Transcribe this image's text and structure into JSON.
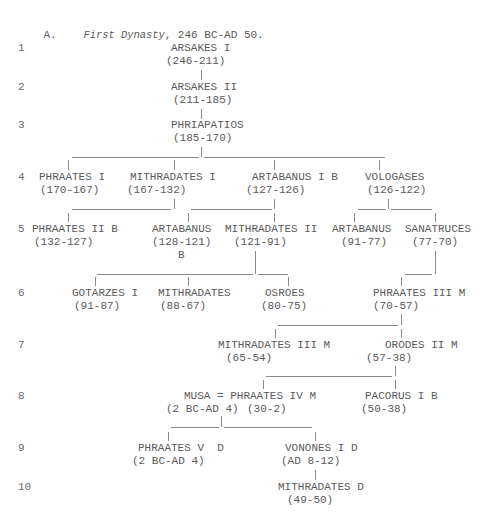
{
  "document": {
    "heading": {
      "prefix": "A.",
      "italic": "First Dynasty",
      "suffix": ", 246 BC-AD 50.",
      "x": 17,
      "y": 23,
      "italic_x": 57
    },
    "generations": [
      {
        "label": "1",
        "y": 49
      },
      {
        "label": "2",
        "y": 88
      },
      {
        "label": "3",
        "y": 126
      },
      {
        "label": "4",
        "y": 178
      },
      {
        "label": "5",
        "y": 230
      },
      {
        "label": "6",
        "y": 294
      },
      {
        "label": "7",
        "y": 346
      },
      {
        "label": "8",
        "y": 397
      },
      {
        "label": "9",
        "y": 449
      },
      {
        "label": "10",
        "y": 488
      }
    ],
    "names": [
      {
        "text": "ARSAKES I",
        "x": 171,
        "y": 49
      },
      {
        "text": "(246-211)",
        "x": 166,
        "y": 62
      },
      {
        "text": "ARSAKES II",
        "x": 171,
        "y": 88
      },
      {
        "text": "(211-185)",
        "x": 173,
        "y": 101
      },
      {
        "text": "PHRIAPATIOS",
        "x": 171,
        "y": 126
      },
      {
        "text": "(185-170)",
        "x": 173,
        "y": 139
      },
      {
        "text": "PHRAATES I",
        "x": 39,
        "y": 178
      },
      {
        "text": "(170-167)",
        "x": 40,
        "y": 191
      },
      {
        "text": "MITHRADATES I",
        "x": 130,
        "y": 178
      },
      {
        "text": "(167-132)",
        "x": 127,
        "y": 191
      },
      {
        "text": "ARTABANUS I B",
        "x": 252,
        "y": 178
      },
      {
        "text": "(127-126)",
        "x": 246,
        "y": 191
      },
      {
        "text": "VOLOGASES",
        "x": 365,
        "y": 178
      },
      {
        "text": "(126-122)",
        "x": 367,
        "y": 191
      },
      {
        "text": "PHRAATES II B",
        "x": 32,
        "y": 230
      },
      {
        "text": "(132-127)",
        "x": 34,
        "y": 243
      },
      {
        "text": "ARTABANUS",
        "x": 152,
        "y": 230
      },
      {
        "text": "(128-121)",
        "x": 152,
        "y": 243
      },
      {
        "text": "B",
        "x": 178,
        "y": 256
      },
      {
        "text": "MITHRADATES II",
        "x": 225,
        "y": 230
      },
      {
        "text": "(121-91)",
        "x": 234,
        "y": 243
      },
      {
        "text": "ARTABANUS",
        "x": 332,
        "y": 230
      },
      {
        "text": "(91-77)",
        "x": 341,
        "y": 243
      },
      {
        "text": "SANATRUCES",
        "x": 405,
        "y": 230
      },
      {
        "text": "(77-70)",
        "x": 412,
        "y": 243
      },
      {
        "text": "GOTARZES I",
        "x": 72,
        "y": 294
      },
      {
        "text": "(91-87)",
        "x": 74,
        "y": 307
      },
      {
        "text": "MITHRADATES",
        "x": 158,
        "y": 294
      },
      {
        "text": "(88-67)",
        "x": 160,
        "y": 307
      },
      {
        "text": "OSROES",
        "x": 265,
        "y": 294
      },
      {
        "text": "(80-75)",
        "x": 261,
        "y": 307
      },
      {
        "text": "PHRAATES III M",
        "x": 373,
        "y": 294
      },
      {
        "text": "(70-57)",
        "x": 373,
        "y": 307
      },
      {
        "text": "MITHRADATES III M",
        "x": 218,
        "y": 346
      },
      {
        "text": "(65-54)",
        "x": 226,
        "y": 359
      },
      {
        "text": "ORODES II M",
        "x": 385,
        "y": 346
      },
      {
        "text": "(57-38)",
        "x": 366,
        "y": 359
      },
      {
        "text": "MUSA = PHRAATES IV M",
        "x": 184,
        "y": 397
      },
      {
        "text": "(2 BC-AD 4)",
        "x": 166,
        "y": 410
      },
      {
        "text": "(30-2)",
        "x": 247,
        "y": 410
      },
      {
        "text": "PACORUS I B",
        "x": 365,
        "y": 397
      },
      {
        "text": "(50-38)",
        "x": 361,
        "y": 410
      },
      {
        "text": "PHRAATES V  D",
        "x": 138,
        "y": 449
      },
      {
        "text": "(2 BC-AD 4)",
        "x": 132,
        "y": 462
      },
      {
        "text": "VONONES I D",
        "x": 285,
        "y": 449
      },
      {
        "text": "(AD 8-12)",
        "x": 281,
        "y": 462
      },
      {
        "text": "MITHRADATES D",
        "x": 278,
        "y": 488
      },
      {
        "text": "(49-50)",
        "x": 287,
        "y": 501
      }
    ],
    "vlines": [
      {
        "x": 201,
        "y1": 70,
        "y2": 80
      },
      {
        "x": 201,
        "y1": 109,
        "y2": 119
      },
      {
        "x": 201,
        "y1": 147,
        "y2": 157
      },
      {
        "x": 68,
        "y1": 160,
        "y2": 170
      },
      {
        "x": 174,
        "y1": 160,
        "y2": 170
      },
      {
        "x": 274,
        "y1": 160,
        "y2": 170
      },
      {
        "x": 379,
        "y1": 160,
        "y2": 170
      },
      {
        "x": 174,
        "y1": 199,
        "y2": 209
      },
      {
        "x": 274,
        "y1": 199,
        "y2": 209
      },
      {
        "x": 388,
        "y1": 199,
        "y2": 209
      },
      {
        "x": 68,
        "y1": 213,
        "y2": 222
      },
      {
        "x": 188,
        "y1": 213,
        "y2": 222
      },
      {
        "x": 274,
        "y1": 213,
        "y2": 222
      },
      {
        "x": 354,
        "y1": 213,
        "y2": 222
      },
      {
        "x": 435,
        "y1": 213,
        "y2": 222
      },
      {
        "x": 255,
        "y1": 251,
        "y2": 274
      },
      {
        "x": 435,
        "y1": 251,
        "y2": 274
      },
      {
        "x": 95,
        "y1": 277,
        "y2": 286
      },
      {
        "x": 188,
        "y1": 277,
        "y2": 286
      },
      {
        "x": 288,
        "y1": 277,
        "y2": 286
      },
      {
        "x": 401,
        "y1": 277,
        "y2": 286
      },
      {
        "x": 401,
        "y1": 314,
        "y2": 325
      },
      {
        "x": 275,
        "y1": 329,
        "y2": 338
      },
      {
        "x": 401,
        "y1": 329,
        "y2": 338
      },
      {
        "x": 395,
        "y1": 366,
        "y2": 376
      },
      {
        "x": 263,
        "y1": 380,
        "y2": 389
      },
      {
        "x": 395,
        "y1": 380,
        "y2": 389
      },
      {
        "x": 221,
        "y1": 416,
        "y2": 427
      },
      {
        "x": 168,
        "y1": 432,
        "y2": 441
      },
      {
        "x": 315,
        "y1": 432,
        "y2": 441
      },
      {
        "x": 315,
        "y1": 470,
        "y2": 480
      }
    ],
    "hlines": [
      {
        "x1": 72,
        "x2": 199,
        "y": 157
      },
      {
        "x1": 204,
        "x2": 385,
        "y": 157
      },
      {
        "x1": 72,
        "x2": 171,
        "y": 209
      },
      {
        "x1": 191,
        "x2": 272,
        "y": 209
      },
      {
        "x1": 358,
        "x2": 386,
        "y": 209
      },
      {
        "x1": 391,
        "x2": 432,
        "y": 209
      },
      {
        "x1": 97,
        "x2": 253,
        "y": 274
      },
      {
        "x1": 258,
        "x2": 288,
        "y": 274
      },
      {
        "x1": 405,
        "x2": 432,
        "y": 274
      },
      {
        "x1": 278,
        "x2": 398,
        "y": 325
      },
      {
        "x1": 266,
        "x2": 392,
        "y": 376
      },
      {
        "x1": 171,
        "x2": 219,
        "y": 427
      },
      {
        "x1": 224,
        "x2": 312,
        "y": 427
      }
    ]
  }
}
